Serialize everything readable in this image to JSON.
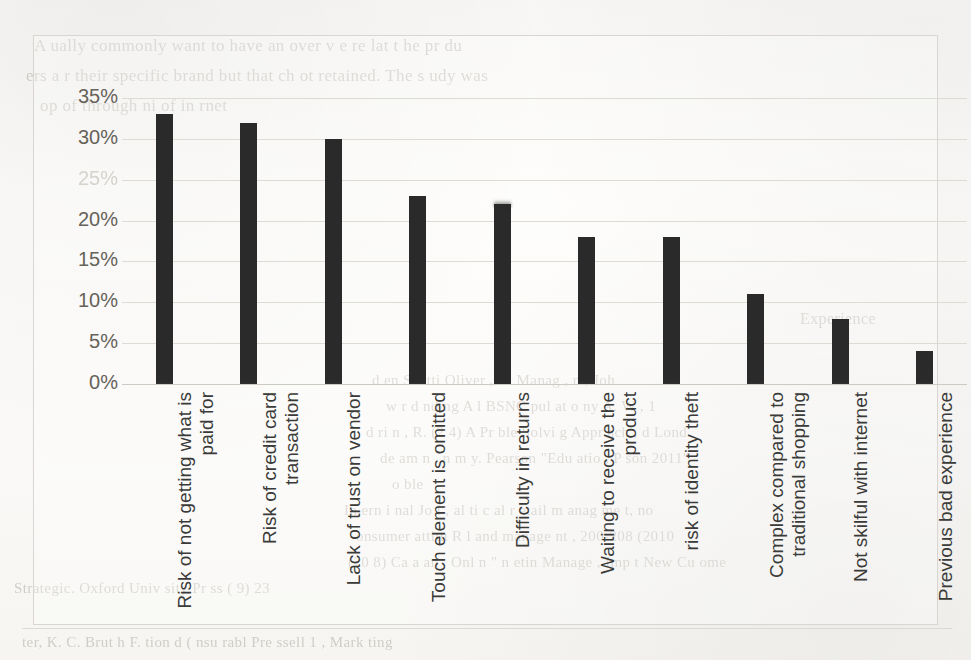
{
  "chart_data": {
    "type": "bar",
    "title": "",
    "subtitle": "",
    "xlabel": "",
    "ylabel": "",
    "ylim": [
      0,
      35
    ],
    "grid": true,
    "legend": "none",
    "orientation": "vertical",
    "value_suffix": "%",
    "yticks": [
      "0%",
      "5%",
      "10%",
      "15%",
      "20%",
      "25%",
      "30%",
      "35%"
    ],
    "ytick_values": [
      0,
      5,
      10,
      15,
      20,
      25,
      30,
      35
    ],
    "faded_yticks": [
      "25%"
    ],
    "categories": [
      "Risk of not getting what is paid for",
      "Risk of credit card transaction",
      "Lack of trust on vendor",
      "Touch element is omitted",
      "Difficulty in returns",
      "Waiting to receive the product",
      "risk of identity theft",
      "Complex compared to traditional shopping",
      "Not skilful with internet",
      "Previous bad experience"
    ],
    "values": [
      33,
      32,
      30,
      23,
      22,
      18,
      18,
      11,
      8,
      4
    ],
    "bar_color": "#2a2a2a"
  },
  "figure": {
    "border_color": "#d9d6d1",
    "gridline_color": "#dedad4",
    "page_background": "#fbfaf8",
    "label_color": "#3a3a38",
    "ytick_color": "#666259"
  },
  "bleed_through_text": {
    "top_lines": [
      "A   ually   commonly   want   to   have   an   over   v e  re   lat   t  he   pr   du",
      "ers   a   r   their  specific  brand       but  that  ch   ot  retained.   The  s  udy   was",
      "op    of   through                           ni      of   in   rnet"
    ],
    "mid_right_lines": [
      "Experience"
    ],
    "lower_right_lines": [
      "d   en      Scotti      Oliver   ,   A.     Manag         ,      n    ,    Joh",
      "w   r    d   nding   A   l   BSNC   pul   at   o         ny   A.   W      ,   1",
      "d  ri  n    ,    R.   (2   4)    A  Pr   ble   Solvi   g   Appr   ach   ,   d   Lond",
      "de  am   n   ,     n   m  y.   Pearson   \"Edu   atio   ,   P    son   2011\"",
      "o   ble",
      "In   ern   i   nal   Jo    l  ,   al     ti     c   al   r   etail   m   anag   me   t,   no",
      "onsumer   attitu      R    l    and   manage      nt     ,   200-208   (2010",
      "(20  8)   Ca   a   an   ,   Onl   n   \"   n   etin   Manage   ,       Imp   t   New   Cu    ome",
      "Strategic.   Oxford   Univ   sity   Pr   ss   (    9)      23",
      "ter,   K.   C.      Brut   h   F.      tion   d   (  nsu   rabl    Pre   ssell   1      ,   Mark   ting"
    ]
  }
}
